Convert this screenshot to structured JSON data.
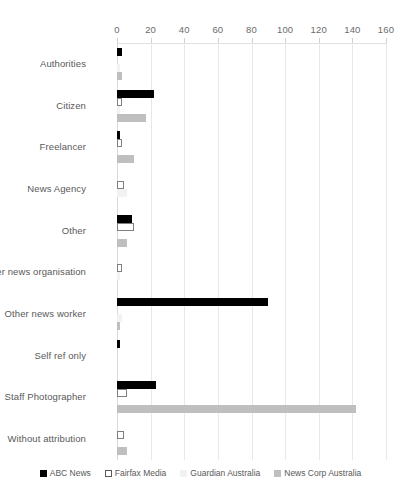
{
  "chart_data": {
    "type": "bar",
    "orientation": "horizontal",
    "title": "",
    "subtitle": "",
    "xlabel": "",
    "ylabel": "",
    "xlim": [
      0,
      160
    ],
    "xticks": [
      0,
      20,
      40,
      60,
      80,
      100,
      120,
      140,
      160
    ],
    "grid": true,
    "legend_position": "bottom",
    "categories": [
      "Authorities",
      "Citizen",
      "Freelancer",
      "News Agency",
      "Other",
      "Other news organisation",
      "Other news worker",
      "Self ref only",
      "Staff Photographer",
      "Without attribution"
    ],
    "series": [
      {
        "name": "ABC News",
        "color": "#000000",
        "values": [
          3,
          22,
          1,
          0,
          9,
          0,
          90,
          1,
          23,
          0
        ]
      },
      {
        "name": "Fairfax Media",
        "color": "#ffffff",
        "values": [
          0,
          3,
          3,
          4,
          10,
          3,
          0,
          0,
          6,
          4
        ]
      },
      {
        "name": "Guardian Australia",
        "color": "#f2f2f2",
        "values": [
          1,
          1,
          0,
          6,
          0,
          1,
          3,
          0,
          0,
          0
        ]
      },
      {
        "name": "News Corp Australia",
        "color": "#bfbfbf",
        "values": [
          3,
          17,
          10,
          0,
          6,
          0,
          1,
          0,
          142,
          6
        ]
      }
    ]
  }
}
